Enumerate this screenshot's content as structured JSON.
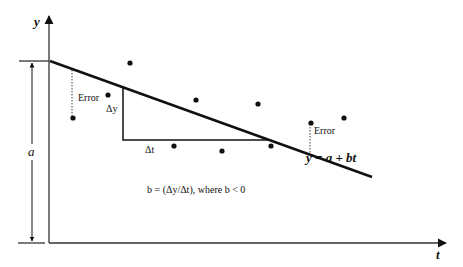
{
  "diagram": {
    "type": "linear-regression-illustration",
    "axes": {
      "y_label": "y",
      "x_label": "t",
      "origin": [
        49,
        243
      ],
      "y_axis_top": 16,
      "x_axis_right": 446
    },
    "intercept": {
      "label": "a",
      "top_y": 61,
      "bottom_y": 243,
      "arrow_x": 32
    },
    "regression_line": {
      "equation": "y = a + bt",
      "start": [
        50,
        61
      ],
      "end": [
        372,
        177
      ]
    },
    "slope_triangle": {
      "dy_label": "Δy",
      "dt_label": "Δt",
      "vertical_x": 123,
      "top_y": 88,
      "bottom_y": 140,
      "right_x": 268
    },
    "slope_formula": "b = (Δy/Δt), where b < 0",
    "error_labels": [
      {
        "label": "Error",
        "line_x": 72,
        "y1": 70,
        "y2": 117,
        "text_x": 78,
        "text_y": 101
      },
      {
        "label": "Error",
        "line_x": 310,
        "y1": 124,
        "y2": 154,
        "text_x": 314,
        "text_y": 134
      }
    ],
    "data_points": [
      [
        73,
        118
      ],
      [
        108,
        95
      ],
      [
        130,
        63
      ],
      [
        174,
        146
      ],
      [
        196,
        100
      ],
      [
        222,
        151
      ],
      [
        258,
        104
      ],
      [
        271,
        146
      ],
      [
        311,
        123
      ],
      [
        344,
        118
      ]
    ],
    "colors": {
      "line": "#111111",
      "axis": "#333333",
      "point": "#111111",
      "background": "#ffffff"
    }
  }
}
